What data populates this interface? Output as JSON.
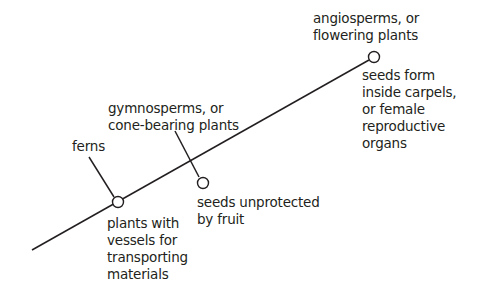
{
  "colors": {
    "line": "#231f20",
    "node_fill": "#ffffff",
    "text": "#231f20",
    "background": "#ffffff"
  },
  "nodes": [
    {
      "id": "ferns",
      "group": "ferns",
      "trait": "plants with\nvessels for\ntransporting\nmaterials"
    },
    {
      "id": "gymnosperms",
      "group": "gymnosperms, or\ncone-bearing plants",
      "trait": "seeds unprotected\nby fruit"
    },
    {
      "id": "angiosperms",
      "group": "angiosperms, or\nflowering plants",
      "trait": "seeds form\ninside carpels,\nor female\nreproductive\norgans"
    }
  ]
}
